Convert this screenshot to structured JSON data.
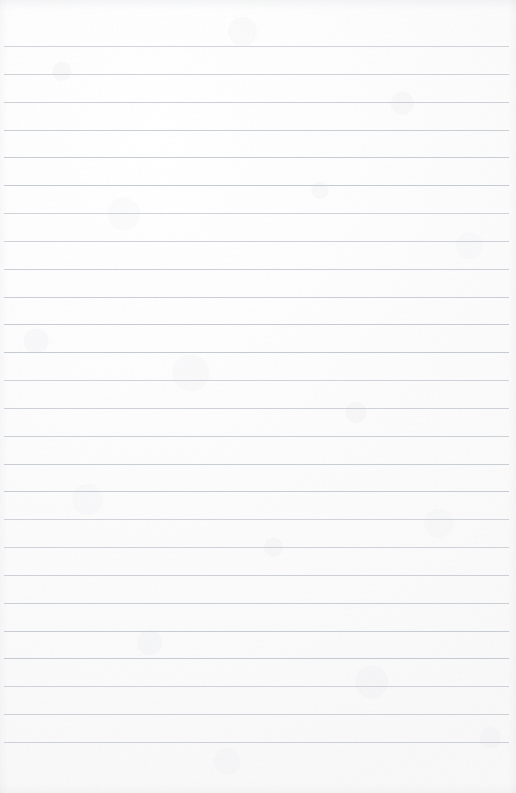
{
  "document": {
    "kind": "ruled-paper",
    "title": "",
    "content_text": "",
    "has_written_content": false,
    "page_width": 516,
    "page_height": 793
  },
  "paper": {
    "background_color": "#fbfbfb",
    "texture": "mottled-fiber",
    "edge_shading": true
  },
  "ruling": {
    "line_color": "#c5cad0",
    "line_thickness_px": 1,
    "line_count": 26,
    "line_spacing_px": 27.84,
    "first_line_y": 46,
    "last_line_y": 742,
    "line_left_x": 4,
    "line_right_x": 509,
    "top_margin_px": 46,
    "bottom_margin_px": 51,
    "has_vertical_margin_rule": false,
    "has_punch_holes": false,
    "line_y_positions": [
      46,
      73.8,
      101.7,
      129.5,
      157.3,
      185.2,
      213.0,
      240.8,
      268.7,
      296.5,
      324.3,
      352.2,
      380.0,
      407.8,
      435.7,
      463.5,
      491.3,
      519.2,
      547.0,
      574.8,
      602.7,
      630.5,
      658.3,
      686.2,
      714.0,
      742.0
    ]
  }
}
